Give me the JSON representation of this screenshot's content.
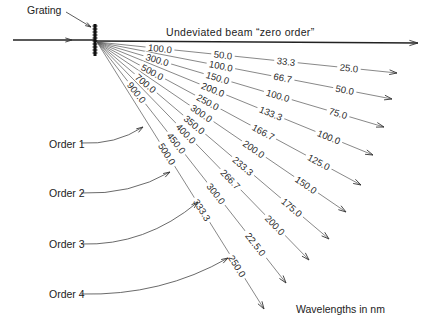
{
  "grating_label": "Grating",
  "zero_order_label": "Undeviated beam “zero order”",
  "units_label": "Wavelengths in nm",
  "order_labels": [
    "Order  1",
    "Order  2",
    "Order  3",
    "Order  4"
  ],
  "rays": [
    {
      "tip": [
        397,
        73
      ],
      "values": [
        "100.0",
        "50.0",
        "33.3",
        "25.0"
      ]
    },
    {
      "tip": [
        392,
        99
      ],
      "values": [
        "",
        "100.0",
        "66.7",
        "50.0"
      ]
    },
    {
      "tip": [
        384,
        127
      ],
      "values": [
        "300.0",
        "150.0",
        "100.0",
        "75.0"
      ]
    },
    {
      "tip": [
        373,
        155
      ],
      "values": [
        "",
        "200.0",
        "133.3",
        "100.0"
      ]
    },
    {
      "tip": [
        361,
        185
      ],
      "values": [
        "500.0",
        "250.0",
        "166.7",
        "125.0"
      ]
    },
    {
      "tip": [
        346,
        212
      ],
      "values": [
        "",
        "300.0",
        "200.0",
        "150.0"
      ]
    },
    {
      "tip": [
        329,
        239
      ],
      "values": [
        "700.0",
        "350.0",
        "233.3",
        "175.0"
      ]
    },
    {
      "tip": [
        309,
        260
      ],
      "values": [
        "",
        "400.0",
        "266.7",
        "200.0"
      ]
    },
    {
      "tip": [
        286,
        283
      ],
      "values": [
        "900.0",
        "450.0",
        "300.0",
        "22.5.0"
      ]
    },
    {
      "tip": [
        264,
        309
      ],
      "values": [
        "",
        "500.0",
        "333.3",
        "250.0"
      ]
    }
  ],
  "colors": {
    "line": "#333333",
    "ray": "#555555",
    "text": "#222222"
  }
}
